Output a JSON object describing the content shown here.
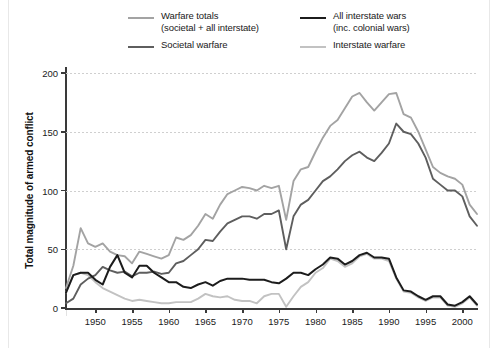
{
  "figure": {
    "title": "",
    "y_axis_title": "Total magnitude of armed conflict"
  },
  "legend": {
    "entries": [
      {
        "label": "Warfare totals\n(societal  +  all interstate)",
        "color": "#a3a3a3",
        "width": 2.6,
        "column": 1,
        "series_key": "warfare_totals"
      },
      {
        "label": "Societal warfare",
        "color": "#5e5e5e",
        "width": 2.6,
        "column": 1,
        "series_key": "societal_warfare"
      },
      {
        "label": "All interstate wars\n(inc. colonial wars)",
        "color": "#1c1c1c",
        "width": 2.8,
        "column": 2,
        "series_key": "all_interstate_wars"
      },
      {
        "label": "Interstate warfare",
        "color": "#c2c2c2",
        "width": 2.2,
        "column": 2,
        "series_key": "interstate_warfare"
      }
    ]
  },
  "chart_data": {
    "type": "line",
    "title": "",
    "xlabel": "",
    "ylabel": "Total magnitude of armed conflict",
    "xlim": [
      1946,
      2002
    ],
    "ylim": [
      0,
      200
    ],
    "yticks": [
      0,
      50,
      100,
      150,
      200
    ],
    "ytick_labels": [
      "0",
      "50",
      "100",
      "150",
      "200"
    ],
    "xticks": [
      1950,
      1955,
      1960,
      1965,
      1970,
      1975,
      1980,
      1985,
      1990,
      1995,
      2000
    ],
    "xtick_labels": [
      "1950",
      "1955",
      "1960",
      "1965",
      "1970",
      "1975",
      "1980",
      "1985",
      "1990",
      "1995",
      "2000"
    ],
    "grid": "horizontal-dotted",
    "legend_position": "above-plot",
    "x": [
      1946,
      1947,
      1948,
      1949,
      1950,
      1951,
      1952,
      1953,
      1954,
      1955,
      1956,
      1957,
      1958,
      1959,
      1960,
      1961,
      1962,
      1963,
      1964,
      1965,
      1966,
      1967,
      1968,
      1969,
      1970,
      1971,
      1972,
      1973,
      1974,
      1975,
      1976,
      1977,
      1978,
      1979,
      1980,
      1981,
      1982,
      1983,
      1984,
      1985,
      1986,
      1987,
      1988,
      1989,
      1990,
      1991,
      1992,
      1993,
      1994,
      1995,
      1996,
      1997,
      1998,
      1999,
      2000,
      2001,
      2002
    ],
    "series": [
      {
        "name": "Warfare totals (societal + all interstate)",
        "key": "warfare_totals",
        "color": "#a3a3a3",
        "values": [
          17,
          36,
          68,
          55,
          52,
          55,
          48,
          45,
          44,
          38,
          48,
          46,
          44,
          42,
          45,
          60,
          58,
          62,
          70,
          80,
          76,
          88,
          97,
          100,
          103,
          102,
          100,
          104,
          102,
          104,
          75,
          108,
          118,
          120,
          133,
          145,
          155,
          160,
          170,
          180,
          183,
          175,
          168,
          175,
          182,
          183,
          165,
          162,
          150,
          135,
          120,
          115,
          112,
          110,
          105,
          88,
          80
        ]
      },
      {
        "name": "Societal warfare",
        "key": "societal_warfare",
        "color": "#5e5e5e",
        "values": [
          4,
          8,
          20,
          25,
          28,
          35,
          32,
          30,
          31,
          27,
          30,
          30,
          31,
          29,
          30,
          38,
          40,
          45,
          50,
          58,
          57,
          65,
          72,
          75,
          78,
          78,
          76,
          80,
          80,
          83,
          50,
          78,
          88,
          92,
          100,
          108,
          112,
          118,
          125,
          130,
          133,
          128,
          125,
          132,
          140,
          157,
          150,
          148,
          140,
          128,
          110,
          105,
          100,
          100,
          95,
          78,
          70
        ]
      },
      {
        "name": "All interstate wars (inc. colonial wars)",
        "key": "all_interstate_wars",
        "color": "#1c1c1c",
        "values": [
          13,
          28,
          30,
          30,
          24,
          20,
          35,
          45,
          30,
          26,
          36,
          36,
          30,
          26,
          22,
          22,
          18,
          17,
          20,
          22,
          19,
          23,
          25,
          25,
          25,
          24,
          24,
          24,
          22,
          21,
          25,
          30,
          30,
          28,
          33,
          37,
          43,
          42,
          37,
          40,
          45,
          47,
          43,
          43,
          42,
          26,
          15,
          14,
          10,
          7,
          10,
          10,
          3,
          2,
          5,
          10,
          3
        ]
      },
      {
        "name": "Interstate warfare",
        "key": "interstate_warfare",
        "color": "#c2c2c2",
        "values": [
          13,
          28,
          30,
          28,
          22,
          17,
          14,
          11,
          8,
          6,
          7,
          6,
          5,
          4,
          4,
          5,
          5,
          5,
          8,
          12,
          10,
          9,
          10,
          7,
          6,
          6,
          4,
          10,
          12,
          12,
          1,
          10,
          18,
          22,
          30,
          34,
          42,
          40,
          35,
          38,
          44,
          46,
          42,
          42,
          40,
          25,
          14,
          13,
          9,
          6,
          9,
          9,
          2,
          1,
          4,
          9,
          2
        ]
      }
    ]
  }
}
